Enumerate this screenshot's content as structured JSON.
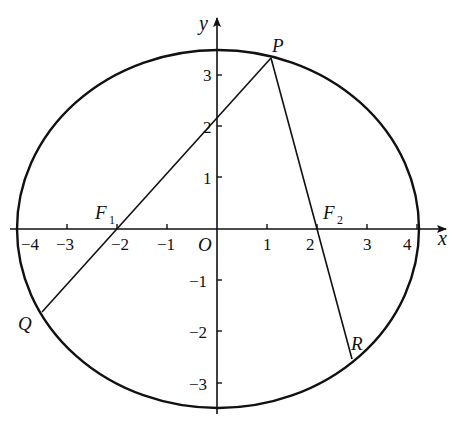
{
  "diagram": {
    "type": "ellipse-with-focal-chords",
    "axes": {
      "x_label": "x",
      "y_label": "y",
      "origin_label": "O",
      "x_ticks": [
        {
          "value": -4,
          "label": "−4"
        },
        {
          "value": -3,
          "label": "−3"
        },
        {
          "value": -2,
          "label": "−2"
        },
        {
          "value": -1,
          "label": "−1"
        },
        {
          "value": 1,
          "label": "1"
        },
        {
          "value": 2,
          "label": "2"
        },
        {
          "value": 3,
          "label": "3"
        },
        {
          "value": 4,
          "label": "4"
        }
      ],
      "y_ticks": [
        {
          "value": 3,
          "label": "3"
        },
        {
          "value": 2,
          "label": "2"
        },
        {
          "value": 1,
          "label": "1"
        },
        {
          "value": -1,
          "label": "−1"
        },
        {
          "value": -2,
          "label": "−2"
        },
        {
          "value": -3,
          "label": "−3"
        }
      ]
    },
    "ellipse": {
      "center": [
        0,
        0
      ],
      "semi_major_x": 4,
      "semi_minor_y": 3.5
    },
    "points": {
      "P": {
        "label": "P",
        "coords": [
          1.1,
          3.3
        ]
      },
      "Q": {
        "label": "Q",
        "coords": [
          -3.5,
          -1.6
        ]
      },
      "R": {
        "label": "R",
        "coords": [
          2.7,
          -2.55
        ]
      },
      "F1": {
        "label": "F",
        "subscript": "1",
        "coords": [
          -2.05,
          0
        ]
      },
      "F2": {
        "label": "F",
        "subscript": "2",
        "coords": [
          2.05,
          0
        ]
      }
    },
    "segments": [
      {
        "from": "P",
        "to": "Q",
        "through": "F1"
      },
      {
        "from": "P",
        "to": "R",
        "through": "F2"
      }
    ]
  }
}
